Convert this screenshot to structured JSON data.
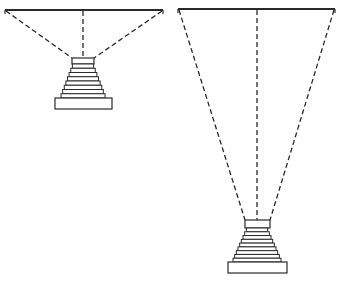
{
  "figure": {
    "stroke_color": "#2a2a2a",
    "background": "#ffffff",
    "views": [
      {
        "id": "near-view",
        "bar": {
          "x1": 5,
          "x2": 163,
          "y": 10
        },
        "apex_center_x": 83,
        "collar": {
          "x": 72,
          "y": 58,
          "w": 22,
          "h": 6
        },
        "steps_top_y": 64,
        "steps_bottom_y": 98,
        "steps_top_half_width": 9,
        "steps_bottom_half_width": 22,
        "step_count": 8,
        "base": {
          "x": 55,
          "y": 98,
          "w": 57,
          "h": 11
        }
      },
      {
        "id": "far-view",
        "bar": {
          "x1": 178,
          "x2": 335,
          "y": 9
        },
        "apex_center_x": 257,
        "collar": {
          "x": 245,
          "y": 220,
          "w": 25,
          "h": 8
        },
        "steps_top_y": 228,
        "steps_bottom_y": 262,
        "steps_top_half_width": 9,
        "steps_bottom_half_width": 24,
        "step_count": 9,
        "base": {
          "x": 228,
          "y": 262,
          "w": 59,
          "h": 11
        }
      }
    ]
  }
}
